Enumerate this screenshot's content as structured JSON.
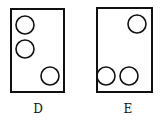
{
  "figures": [
    {
      "label": "D",
      "rect": {
        "x": 11,
        "y": 9,
        "w": 53,
        "h": 83
      },
      "circles": [
        {
          "cx": 25,
          "cy": 25,
          "r": 9
        },
        {
          "cx": 25,
          "cy": 49,
          "r": 9
        },
        {
          "cx": 50,
          "cy": 76,
          "r": 9
        }
      ]
    },
    {
      "label": "E",
      "rect": {
        "x": 97,
        "y": 8,
        "w": 55,
        "h": 84
      },
      "circles": [
        {
          "cx": 137,
          "cy": 24,
          "r": 9
        },
        {
          "cx": 106,
          "cy": 76,
          "r": 9
        },
        {
          "cx": 129,
          "cy": 76,
          "r": 9
        }
      ]
    }
  ],
  "colors": {
    "stroke": "#111111",
    "background": "#ffffff"
  }
}
